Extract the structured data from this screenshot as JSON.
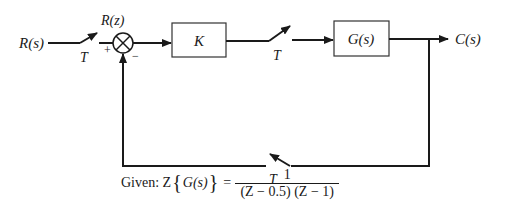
{
  "diagram": {
    "type": "sampled-data closed-loop block diagram",
    "input": {
      "label": "R(s)"
    },
    "input_sampler": {
      "label": "T"
    },
    "sampled_signal": {
      "label": "R(z)"
    },
    "summing_junction": {
      "plus_sign": "+",
      "minus_sign": "−"
    },
    "controller_block": {
      "label": "K"
    },
    "forward_sampler": {
      "label": "T"
    },
    "plant_block": {
      "label": "G(s)"
    },
    "output": {
      "label": "C(s)"
    },
    "feedback_sampler": {
      "label": "T"
    }
  },
  "given": {
    "prefix": "Given: Z",
    "operand": "G(s)",
    "equals": "=",
    "numerator": "1",
    "denominator": "(Z − 0.5) (Z − 1)"
  }
}
